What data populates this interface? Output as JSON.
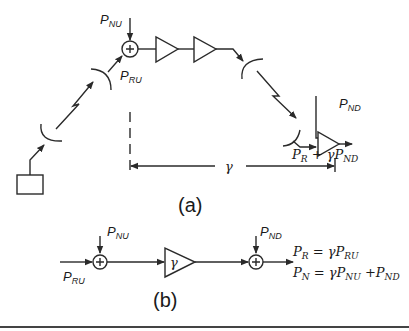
{
  "diagram": {
    "part_a": {
      "caption": "(a)",
      "labels": {
        "p_nu": {
          "base": "P",
          "sub": "NU"
        },
        "p_ru": {
          "base": "P",
          "sub": "RU"
        },
        "p_nd": {
          "base": "P",
          "sub": "ND"
        },
        "gamma": "γ",
        "output_expr": {
          "pr_base": "P",
          "pr_sub": "R",
          "plus_gamma": " + γP",
          "nd_sub": "ND"
        }
      },
      "components": [
        "ground-terminal",
        "uplink-dish",
        "satellite-receive-dish",
        "summing-junction",
        "amplifier-1",
        "amplifier-2",
        "satellite-transmit-dish",
        "downlink-dish",
        "receiver-amplifier"
      ]
    },
    "part_b": {
      "caption": "(b)",
      "labels": {
        "p_nu": {
          "base": "P",
          "sub": "NU"
        },
        "p_ru": {
          "base": "P",
          "sub": "RU"
        },
        "p_nd": {
          "base": "P",
          "sub": "ND"
        },
        "gain": "γ"
      },
      "equations": {
        "eq1": {
          "lhs_base": "P",
          "lhs_sub": "R",
          "rhs": " = γP",
          "rhs_sub": "RU"
        },
        "eq2": {
          "lhs_base": "P",
          "lhs_sub": "N",
          "rhs": " = γP",
          "rhs_sub": "NU",
          "plus": " +P",
          "plus_sub": "ND"
        }
      }
    }
  }
}
